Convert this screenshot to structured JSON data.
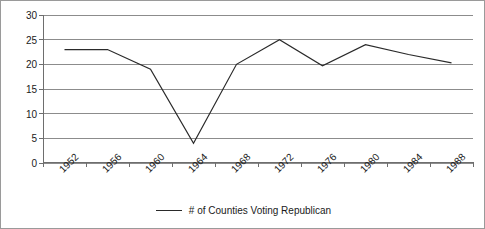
{
  "chart_data": {
    "type": "line",
    "title": "",
    "subtitle": "",
    "xlabel": "",
    "ylabel": "",
    "categories": [
      "1952",
      "1956",
      "1960",
      "1964",
      "1968",
      "1972",
      "1976",
      "1980",
      "1984",
      "1988"
    ],
    "series": [
      {
        "name": "# of Counties Voting Republican",
        "color": "#2a2a2a",
        "values": [
          23,
          23,
          19,
          4,
          20,
          25,
          19.7,
          24,
          22,
          20.3
        ]
      }
    ],
    "ylim": [
      0,
      30
    ],
    "ytick_labels": [
      "0",
      "5",
      "10",
      "15",
      "20",
      "25",
      "30"
    ],
    "ytick_values": [
      0,
      5,
      10,
      15,
      20,
      25,
      30
    ],
    "grid": "horizontal",
    "legend_position": "bottom-center",
    "annotations": []
  },
  "legend": {
    "entries": [
      {
        "label": "# of Counties Voting Republican",
        "swatch": "line-swatch"
      }
    ]
  },
  "colors": {
    "series_line": "#2a2a2a",
    "gridline": "#8c8c8c",
    "axis": "#6e6e6e",
    "border": "#9a9a9a",
    "text": "#1a1a1a",
    "background": "#ffffff"
  }
}
